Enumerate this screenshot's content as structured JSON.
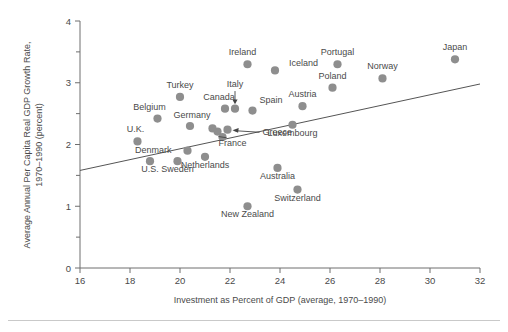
{
  "chart_data": {
    "type": "scatter",
    "title": "",
    "xlabel": "Investment as Percent of GDP (average, 1970–1990)",
    "ylabel_line1": "Average Annual Per Capita Real GDP Growth Rate,",
    "ylabel_line2": "1970–1990 (percent)",
    "xlim": [
      16,
      32
    ],
    "ylim": [
      0,
      4
    ],
    "xticks": [
      16,
      18,
      20,
      22,
      24,
      26,
      28,
      30,
      32
    ],
    "xtick_labels": [
      "16",
      "18",
      "20",
      "22",
      "24",
      "26",
      "28",
      "30",
      "32"
    ],
    "yticks": [
      0,
      1,
      2,
      3,
      4
    ],
    "ytick_labels": [
      "0",
      "1",
      "2",
      "3",
      "4"
    ],
    "y_minor_ticks": [
      0.5,
      1.5,
      2.5,
      3.5
    ],
    "grid": false,
    "legend": "none",
    "marker_color": "#8e8e8e",
    "axis_color": "#6e6e6e",
    "text_color": "#4a4a4a",
    "trendline": {
      "label": "regression line",
      "x_start": 16.0,
      "y_start": 1.58,
      "x_end": 32.0,
      "y_end": 2.98
    },
    "points": [
      {
        "name": "Japan",
        "x": 31.0,
        "y": 3.38,
        "label_dx": 0,
        "label_dy": -9,
        "anchor": "middle"
      },
      {
        "name": "Ireland",
        "x": 22.7,
        "y": 3.3,
        "label_dx": -5,
        "label_dy": -9,
        "anchor": "middle"
      },
      {
        "name": "Iceland",
        "x": 23.8,
        "y": 3.2,
        "label_dx": 14,
        "label_dy": -4,
        "anchor": "start"
      },
      {
        "name": "Portugal",
        "x": 26.3,
        "y": 3.3,
        "label_dx": 0,
        "label_dy": -9,
        "anchor": "middle"
      },
      {
        "name": "Norway",
        "x": 28.1,
        "y": 3.07,
        "label_dx": 0,
        "label_dy": -9,
        "anchor": "middle"
      },
      {
        "name": "Poland",
        "x": 26.1,
        "y": 2.92,
        "label_dx": 0,
        "label_dy": -9,
        "anchor": "middle"
      },
      {
        "name": "Turkey",
        "x": 20.0,
        "y": 2.77,
        "label_dx": 0,
        "label_dy": -9,
        "anchor": "middle"
      },
      {
        "name": "Canada",
        "x": 21.8,
        "y": 2.58,
        "label_dx": -6,
        "label_dy": -9,
        "anchor": "middle"
      },
      {
        "name": "Spain",
        "x": 22.9,
        "y": 2.55,
        "label_dx": 7,
        "label_dy": -8,
        "anchor": "start"
      },
      {
        "name": "Austria",
        "x": 24.9,
        "y": 2.62,
        "label_dx": 0,
        "label_dy": -9,
        "anchor": "middle"
      },
      {
        "name": "Belgium",
        "x": 19.1,
        "y": 2.42,
        "label_dx": -8,
        "label_dy": -9,
        "anchor": "middle"
      },
      {
        "name": "Germany",
        "x": 20.4,
        "y": 2.3,
        "label_dx": 2,
        "label_dy": -8,
        "anchor": "middle"
      },
      {
        "name": "Luxembourg",
        "x": 24.5,
        "y": 2.32,
        "label_dx": 0,
        "label_dy": 11,
        "anchor": "middle"
      },
      {
        "name": "U.K.",
        "x": 18.3,
        "y": 2.05,
        "label_dx": -2,
        "label_dy": -9,
        "anchor": "middle"
      },
      {
        "name": "Denmark",
        "x": 20.3,
        "y": 1.9,
        "label_dx": -16,
        "label_dy": 2,
        "anchor": "end"
      },
      {
        "name": "Netherlands",
        "x": 21.0,
        "y": 1.8,
        "label_dx": 0,
        "label_dy": 11,
        "anchor": "middle"
      },
      {
        "name": "U.S.",
        "x": 18.8,
        "y": 1.73,
        "label_dx": 0,
        "label_dy": 11,
        "anchor": "middle"
      },
      {
        "name": "Sweden",
        "x": 19.9,
        "y": 1.73,
        "label_dx": 0,
        "label_dy": 11,
        "anchor": "middle"
      },
      {
        "name": "Australia",
        "x": 23.9,
        "y": 1.62,
        "label_dx": 0,
        "label_dy": 11,
        "anchor": "middle"
      },
      {
        "name": "Switzerland",
        "x": 24.7,
        "y": 1.27,
        "label_dx": 0,
        "label_dy": 11,
        "anchor": "middle"
      },
      {
        "name": "New Zealand",
        "x": 22.7,
        "y": 1.0,
        "label_dx": 0,
        "label_dy": 11,
        "anchor": "middle"
      }
    ],
    "cluster_points": [
      {
        "name": "Italy",
        "x": 22.2,
        "y": 2.58
      },
      {
        "name": "France",
        "x": 21.5,
        "y": 2.21
      },
      {
        "name": "Greece",
        "x": 21.9,
        "y": 2.24
      },
      {
        "name": "cluster-extra-1",
        "x": 21.3,
        "y": 2.26
      },
      {
        "name": "cluster-extra-2",
        "x": 21.7,
        "y": 2.12
      }
    ],
    "callout_labels": [
      {
        "name": "Italy",
        "text": "Italy",
        "x": 22.2,
        "y": 2.93,
        "anchor": "middle"
      },
      {
        "name": "France",
        "text": "France",
        "x": 22.1,
        "y": 1.98,
        "anchor": "middle"
      },
      {
        "name": "Greece",
        "text": "Greece",
        "x": 23.3,
        "y": 2.15,
        "anchor": "start"
      }
    ]
  }
}
